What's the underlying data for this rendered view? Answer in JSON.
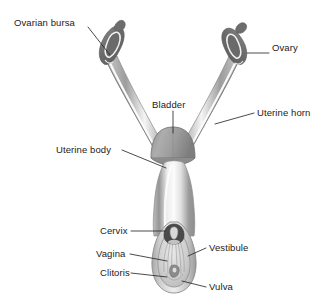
{
  "figure": {
    "background_color": "#ffffff",
    "line_color": "#2b2b2b",
    "tissue_outline_color": "#8d8d8d",
    "tissue_wall_color": "#a9a9a9",
    "tissue_lumen_color": "#f2f2f2",
    "organ_dark_color": "#6e6e6e",
    "bladder_color": "#9b9b9b"
  },
  "labels": [
    {
      "id": "ovarian-bursa",
      "text": "Ovarian bursa",
      "x": 14,
      "y": 17,
      "align": "left",
      "leader": {
        "x1": 88,
        "y1": 27,
        "x2": 110,
        "y2": 55
      }
    },
    {
      "id": "ovary",
      "text": "Ovary",
      "x": 272,
      "y": 48,
      "align": "left",
      "leader": {
        "x1": 269,
        "y1": 53,
        "x2": 247,
        "y2": 53
      }
    },
    {
      "id": "bladder",
      "text": "Bladder",
      "x": 152,
      "y": 99,
      "align": "left",
      "leader": {
        "x1": 173,
        "y1": 111,
        "x2": 173,
        "y2": 133
      }
    },
    {
      "id": "uterine-horn",
      "text": "Uterine horn",
      "x": 257,
      "y": 108,
      "align": "left",
      "leader": {
        "x1": 254,
        "y1": 113,
        "x2": 215,
        "y2": 124
      }
    },
    {
      "id": "uterine-body",
      "text": "Uterine body",
      "x": 56,
      "y": 143,
      "align": "left",
      "leader": {
        "x1": 122,
        "y1": 150,
        "x2": 166,
        "y2": 168
      }
    },
    {
      "id": "cervix",
      "text": "Cervix",
      "x": 100,
      "y": 226,
      "align": "left",
      "leader": {
        "x1": 131,
        "y1": 231,
        "x2": 165,
        "y2": 231
      }
    },
    {
      "id": "vagina",
      "text": "Vagina",
      "x": 96,
      "y": 249,
      "align": "left",
      "leader": {
        "x1": 130,
        "y1": 254,
        "x2": 167,
        "y2": 261
      }
    },
    {
      "id": "clitoris",
      "text": "Clitoris",
      "x": 100,
      "y": 268,
      "align": "left",
      "leader": {
        "x1": 131,
        "y1": 273,
        "x2": 167,
        "y2": 277
      }
    },
    {
      "id": "vestibule",
      "text": "Vestibule",
      "x": 209,
      "y": 243,
      "align": "left",
      "leader": {
        "x1": 206,
        "y1": 248,
        "x2": 188,
        "y2": 256
      }
    },
    {
      "id": "vulva",
      "text": "Vulva",
      "x": 209,
      "y": 283,
      "align": "left",
      "leader": {
        "x1": 206,
        "y1": 287,
        "x2": 182,
        "y2": 281
      }
    }
  ],
  "structures": [
    {
      "id": "left-oviduct",
      "name": "left uterine horn / oviduct"
    },
    {
      "id": "right-oviduct",
      "name": "right uterine horn / oviduct"
    },
    {
      "id": "left-ovary-mass",
      "name": "left ovary within ovarian bursa"
    },
    {
      "id": "right-ovary-mass",
      "name": "right ovary within ovarian bursa"
    },
    {
      "id": "bladder-dome",
      "name": "urinary bladder"
    },
    {
      "id": "uterine-body-tube",
      "name": "uterine body and vaginal canal"
    },
    {
      "id": "cervix-opening",
      "name": "cervix"
    },
    {
      "id": "vestibule-cavity",
      "name": "vestibule with rugae"
    },
    {
      "id": "clitoris-body",
      "name": "clitoris"
    },
    {
      "id": "vulva-outline",
      "name": "vulva"
    }
  ]
}
